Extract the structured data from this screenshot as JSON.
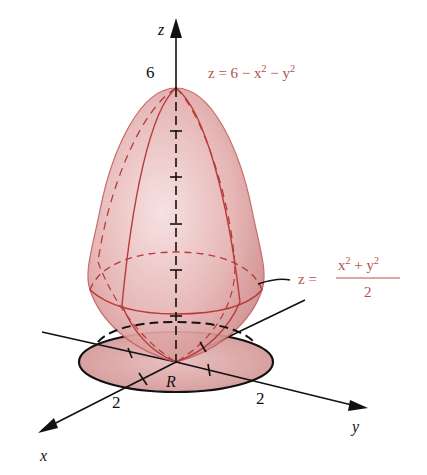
{
  "figure": {
    "colors": {
      "surface_fill": "#e8b4b4",
      "surface_edge": "#b83a3a",
      "axis": "#111111",
      "label": "#b4504a",
      "region_fill": "#d9a3a3"
    },
    "axes": {
      "x_label": "x",
      "y_label": "y",
      "z_label": "z"
    },
    "ticks": {
      "z_top": "6",
      "x_mark": "2",
      "y_mark": "2"
    },
    "region_label": "R",
    "upper_surface": {
      "lhs": "z = 6 − x",
      "sup1": "2",
      "mid": " − y",
      "sup2": "2"
    },
    "lower_surface": {
      "lhs": "z =",
      "num_a": "x",
      "num_sup_a": "2",
      "num_plus": " + y",
      "num_sup_b": "2",
      "den": "2"
    }
  }
}
